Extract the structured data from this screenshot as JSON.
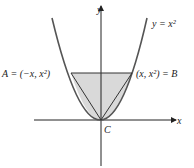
{
  "diagram": {
    "curve_label": "y = x²",
    "y_axis_label": "y",
    "x_axis_label": "x",
    "point_a_label": "A = (−x, x²)",
    "point_b_label": "(x, x²) = B",
    "point_c_label": "C",
    "colors": {
      "curve": "#555555",
      "axes": "#222222",
      "shade": "#d9d9d9",
      "lines": "#333333"
    }
  }
}
